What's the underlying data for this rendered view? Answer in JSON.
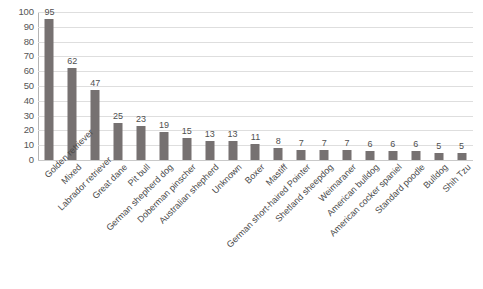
{
  "chart_data": {
    "type": "bar",
    "title": "",
    "xlabel": "",
    "ylabel": "",
    "ylim": [
      0,
      100
    ],
    "ytick_step": 10,
    "yticks": [
      100,
      90,
      80,
      70,
      60,
      50,
      40,
      30,
      20,
      10,
      0
    ],
    "grid": true,
    "grid_axis": "y",
    "legend": false,
    "legend_position": "none",
    "bar_color": "#767171",
    "gridline_color": "#dedede",
    "data_labels": true,
    "xtick_label_rotation": -45,
    "categories": [
      "Golden retriever",
      "Mixed",
      "Labrador retriever",
      "Great dane",
      "Pit bull",
      "German shepherd dog",
      "Doberman pinscher",
      "Australian shepherd",
      "Unknown",
      "Boxer",
      "Mastiff",
      "German short-haired Pointer",
      "Shetland sheepdog",
      "Weimaraner",
      "American bulldog",
      "American cocker spaniel",
      "Standard poodle",
      "Bulldog",
      "Shih Tzu"
    ],
    "values": [
      95,
      62,
      47,
      25,
      23,
      19,
      15,
      13,
      13,
      11,
      8,
      7,
      7,
      7,
      6,
      6,
      6,
      5,
      5
    ]
  },
  "caption": {
    "text": ""
  }
}
